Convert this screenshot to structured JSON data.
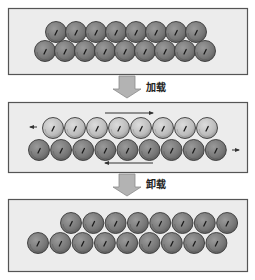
{
  "diagram": {
    "panels": [
      {
        "id": "initial",
        "box": {
          "x": 8,
          "y": 8,
          "w": 239,
          "h": 66
        },
        "rows": [
          {
            "name": "top-row",
            "start_x": 56,
            "y": 32,
            "count": 8,
            "spacing": 20,
            "fill": "#7a7a7a",
            "highlight": "#9a9a9a"
          },
          {
            "name": "bottom-row",
            "start_x": 45,
            "y": 51,
            "count": 9,
            "spacing": 20,
            "fill": "#7a7a7a",
            "highlight": "#9a9a9a"
          }
        ]
      },
      {
        "id": "loaded",
        "box": {
          "x": 8,
          "y": 102,
          "w": 239,
          "h": 70
        },
        "rows": [
          {
            "name": "top-row",
            "start_x": 53,
            "y": 128,
            "count": 8,
            "spacing": 22,
            "fill": "#bdbdbd",
            "highlight": "#d8d8d8"
          },
          {
            "name": "bottom-row",
            "start_x": 39,
            "y": 150,
            "count": 9,
            "spacing": 22.1,
            "fill": "#7a7a7a",
            "highlight": "#9a9a9a"
          }
        ],
        "shear_arrows": [
          {
            "name": "top-shear-arrow",
            "x1": 105,
            "x2": 153,
            "y": 113,
            "direction": "right"
          },
          {
            "name": "bottom-shear-arrow",
            "x1": 105,
            "x2": 153,
            "y": 163,
            "direction": "left"
          },
          {
            "name": "left-small-arrow",
            "x1": 30,
            "x2": 37,
            "y": 127,
            "direction": "left"
          },
          {
            "name": "right-small-arrow",
            "x1": 232,
            "x2": 239,
            "y": 150,
            "direction": "right"
          }
        ]
      },
      {
        "id": "unloaded",
        "box": {
          "x": 8,
          "y": 199,
          "w": 239,
          "h": 72
        },
        "rows": [
          {
            "name": "top-row",
            "start_x": 71,
            "y": 223,
            "count": 8,
            "spacing": 22.3,
            "fill": "#7a7a7a",
            "highlight": "#9a9a9a"
          },
          {
            "name": "bottom-row",
            "start_x": 38,
            "y": 243,
            "count": 9,
            "spacing": 22.3,
            "fill": "#7a7a7a",
            "highlight": "#9a9a9a"
          }
        ]
      }
    ],
    "transitions": [
      {
        "name": "loading",
        "label": "加载",
        "arrow": {
          "x": 127,
          "y": 76
        },
        "label_pos": {
          "x": 146,
          "y": 79
        }
      },
      {
        "name": "unloading",
        "label": "卸载",
        "arrow": {
          "x": 127,
          "y": 174
        },
        "label_pos": {
          "x": 146,
          "y": 176
        }
      }
    ],
    "atom_radius": 10.5,
    "colors": {
      "panel_fill": "#ececec",
      "panel_border": "#555555",
      "atom_stroke": "#3a3a3a",
      "block_arrow_fill": "#b3b3b3",
      "block_arrow_stroke": "#8a8a8a",
      "shear_arrow": "#333333"
    }
  }
}
